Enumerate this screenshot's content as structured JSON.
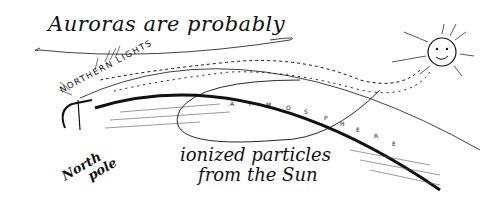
{
  "title": "Auroras are probably",
  "labels": {
    "northern_lights": "NORTHERN LIGHTS",
    "atmosphere_letters": [
      "A",
      "T",
      "M",
      "O",
      "S",
      "P",
      "H",
      "E",
      "R",
      "E"
    ],
    "north_pole": [
      "North",
      "pole"
    ],
    "ionized": "ionized particles",
    "from_sun": "from the Sun"
  },
  "colors": {
    "ink": "#111111",
    "paper": "#ffffff"
  }
}
